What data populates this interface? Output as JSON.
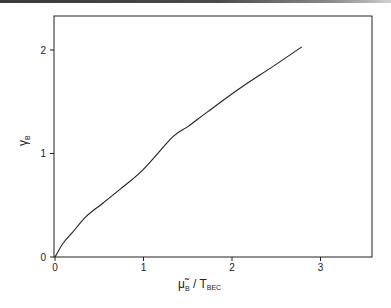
{
  "chart_data": {
    "type": "line",
    "title": "",
    "xlabel": "μ̃_B / T_BEC",
    "ylabel": "γ_B",
    "xlim": [
      0,
      3.6
    ],
    "ylim": [
      0,
      2.32
    ],
    "grid": false,
    "legend": null,
    "x_ticks": [
      0,
      1,
      2,
      3
    ],
    "y_ticks": [
      0,
      1,
      2
    ],
    "series": [
      {
        "name": "γ_B",
        "color": "#222222",
        "x": [
          0,
          0.09,
          0.2,
          0.35,
          0.54,
          0.73,
          0.99,
          1.33,
          1.5,
          1.72,
          2.09,
          2.46,
          2.79
        ],
        "y": [
          0,
          0.13,
          0.24,
          0.39,
          0.52,
          0.65,
          0.84,
          1.16,
          1.26,
          1.4,
          1.63,
          1.84,
          2.03
        ]
      }
    ]
  },
  "axes": {
    "x_tick_labels": [
      "0",
      "1",
      "2",
      "3"
    ],
    "y_tick_labels": [
      "0",
      "1",
      "2"
    ],
    "xlabel_main": "μ̃",
    "xlabel_sub1": "B",
    "xlabel_mid": " / T",
    "xlabel_sub2": "BEC",
    "ylabel_main": "γ",
    "ylabel_sub": "B"
  }
}
